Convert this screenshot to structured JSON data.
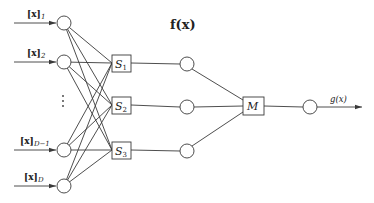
{
  "diagram": {
    "title": "f(x)",
    "inputs": [
      {
        "label": "[x]",
        "sub": "1",
        "cy": 23
      },
      {
        "label": "[x]",
        "sub": "2",
        "cy": 62
      },
      {
        "label": "[x]",
        "sub": "D−1",
        "cy": 150
      },
      {
        "label": "[x]",
        "sub": "D",
        "cy": 186
      }
    ],
    "ellipsis": "⋮",
    "s_boxes": [
      {
        "label": "S",
        "sub": "1",
        "cy": 63
      },
      {
        "label": "S",
        "sub": "2",
        "cy": 105
      },
      {
        "label": "S",
        "sub": "3",
        "cy": 150
      }
    ],
    "hidden_nodes": [
      64,
      107,
      151
    ],
    "merge_box": {
      "label": "M",
      "cy": 106
    },
    "output_label": "g(x)",
    "stroke_color": "#3a3a3a"
  }
}
